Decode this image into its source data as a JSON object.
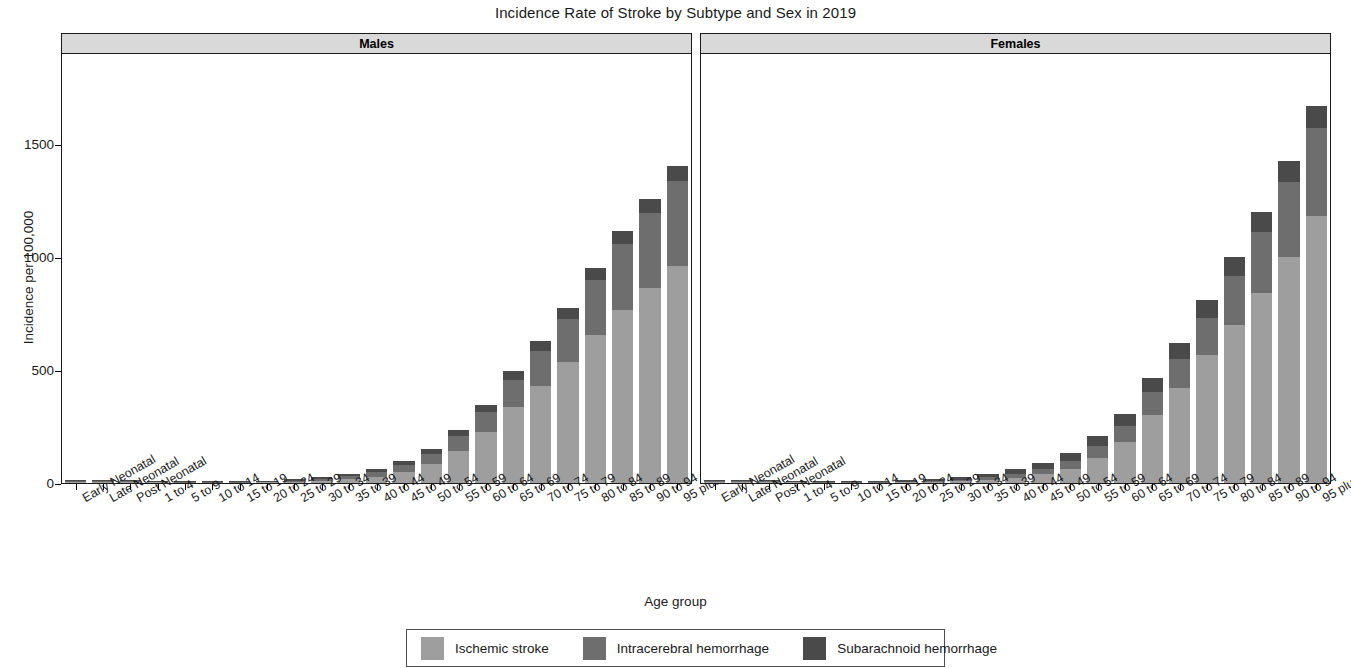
{
  "chart_data": {
    "type": "bar",
    "subtype": "stacked-bar-faceted",
    "title": "Incidence Rate of Stroke by Subtype and Sex in 2019",
    "xlabel": "Age group",
    "ylabel": "Incidence per 100,000",
    "ylim": [
      0,
      1900
    ],
    "yticks": [
      0,
      500,
      1000,
      1500
    ],
    "ytick_labels": [
      "0",
      "500",
      "1000",
      "1500"
    ],
    "grid": false,
    "legend_position": "bottom",
    "facet_variable": "Sex",
    "facets": [
      "Males",
      "Females"
    ],
    "categories": [
      "Early Neonatal",
      "Late Neonatal",
      "Post Neonatal",
      "1 to 4",
      "5 to 9",
      "10 to 14",
      "15 to 19",
      "20 to 24",
      "25 to 29",
      "30 to 34",
      "35 to 39",
      "40 to 44",
      "45 to 49",
      "50 to 54",
      "55 to 59",
      "60 to 64",
      "65 to 69",
      "70 to 74",
      "75 to 79",
      "80 to 84",
      "85 to 89",
      "90 to 94",
      "95 plus"
    ],
    "series_names": [
      "Ischemic stroke",
      "Intracerebral hemorrhage",
      "Subarachnoid hemorrhage"
    ],
    "series_colors": [
      "#9e9e9e",
      "#6e6e6e",
      "#4a4a4a"
    ],
    "panels": [
      {
        "name": "Males",
        "series": [
          {
            "name": "Ischemic stroke",
            "values": [
              4,
              4,
              4,
              3,
              2,
              2,
              2,
              3,
              5,
              9,
              16,
              28,
              50,
              86,
              143,
              225,
              335,
              430,
              535,
              655,
              765,
              860,
              960
            ]
          },
          {
            "name": "Intracerebral hemorrhage",
            "values": [
              4,
              3,
              3,
              2,
              2,
              2,
              2,
              3,
              5,
              8,
              13,
              20,
              30,
              44,
              64,
              90,
              120,
              155,
              190,
              240,
              290,
              335,
              375
            ]
          },
          {
            "name": "Subarachnoid hemorrhage",
            "values": [
              6,
              5,
              5,
              4,
              3,
              3,
              4,
              5,
              7,
              9,
              12,
              15,
              18,
              22,
              27,
              32,
              38,
              44,
              50,
              55,
              58,
              62,
              65
            ]
          }
        ],
        "totals": [
          14,
          12,
          12,
          9,
          7,
          7,
          8,
          11,
          17,
          26,
          41,
          63,
          98,
          152,
          234,
          347,
          493,
          629,
          775,
          950,
          1113,
          1257,
          1400
        ]
      },
      {
        "name": "Females",
        "series": [
          {
            "name": "Ischemic stroke",
            "values": [
              4,
              4,
              4,
              3,
              2,
              2,
              2,
              3,
              5,
              8,
              14,
              23,
              38,
              64,
              110,
              180,
              300,
              420,
              565,
              700,
              840,
              1000,
              1180
            ]
          },
          {
            "name": "Intracerebral hemorrhage",
            "values": [
              4,
              3,
              3,
              2,
              2,
              2,
              2,
              3,
              4,
              7,
              11,
              16,
              24,
              35,
              52,
              72,
              100,
              130,
              165,
              215,
              270,
              330,
              390
            ]
          },
          {
            "name": "Subarachnoid hemorrhage",
            "values": [
              6,
              5,
              5,
              4,
              3,
              3,
              4,
              6,
              9,
              12,
              17,
              22,
              28,
              35,
              44,
              53,
              62,
              70,
              78,
              84,
              88,
              92,
              95
            ]
          }
        ],
        "totals": [
          14,
          12,
          12,
          9,
          7,
          7,
          8,
          12,
          18,
          27,
          42,
          61,
          90,
          134,
          206,
          305,
          462,
          620,
          808,
          999,
          1198,
          1422,
          1665
        ]
      }
    ]
  },
  "legend": {
    "items": [
      {
        "label": "Ischemic stroke",
        "color": "#9e9e9e"
      },
      {
        "label": "Intracerebral hemorrhage",
        "color": "#6e6e6e"
      },
      {
        "label": "Subarachnoid hemorrhage",
        "color": "#4a4a4a"
      }
    ]
  }
}
